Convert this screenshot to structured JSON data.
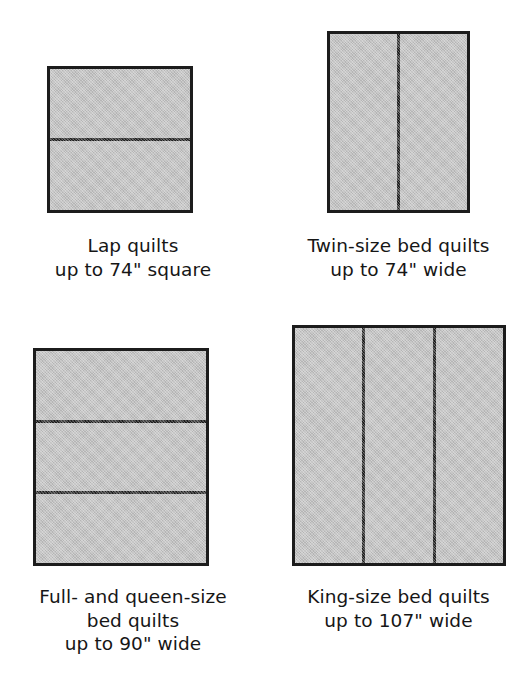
{
  "figure": {
    "background_color": "#ffffff",
    "fill_color": "#c4c4c4",
    "line_color": "#1c1c1c"
  },
  "items": [
    {
      "id": "lap-quilts",
      "name": "Lap quilts",
      "orientation": "rows",
      "panel_count": 2,
      "caption_lines": [
        "Lap quilts",
        "up to 74\" square"
      ],
      "measurement": "74\"",
      "measurement_text": "up to 74\" square"
    },
    {
      "id": "twin-size-bed-quilts",
      "name": "Twin-size bed quilts",
      "orientation": "cols",
      "panel_count": 2,
      "caption_lines": [
        "Twin-size bed quilts",
        "up to 74\" wide"
      ],
      "measurement": "74\"",
      "measurement_text": "up to 74\" wide"
    },
    {
      "id": "full-and-queen-size-bed-quilts",
      "name": "Full- and queen-size bed quilts",
      "orientation": "rows",
      "panel_count": 3,
      "caption_lines": [
        "Full- and queen-size",
        "bed quilts",
        "up to 90\" wide"
      ],
      "measurement": "90\"",
      "measurement_text": "up to 90\" wide"
    },
    {
      "id": "king-size-bed-quilts",
      "name": "King-size bed quilts",
      "orientation": "cols",
      "panel_count": 3,
      "caption_lines": [
        "King-size bed quilts",
        "up to 107\" wide"
      ],
      "measurement": "107\"",
      "measurement_text": "up to 107\" wide"
    }
  ]
}
